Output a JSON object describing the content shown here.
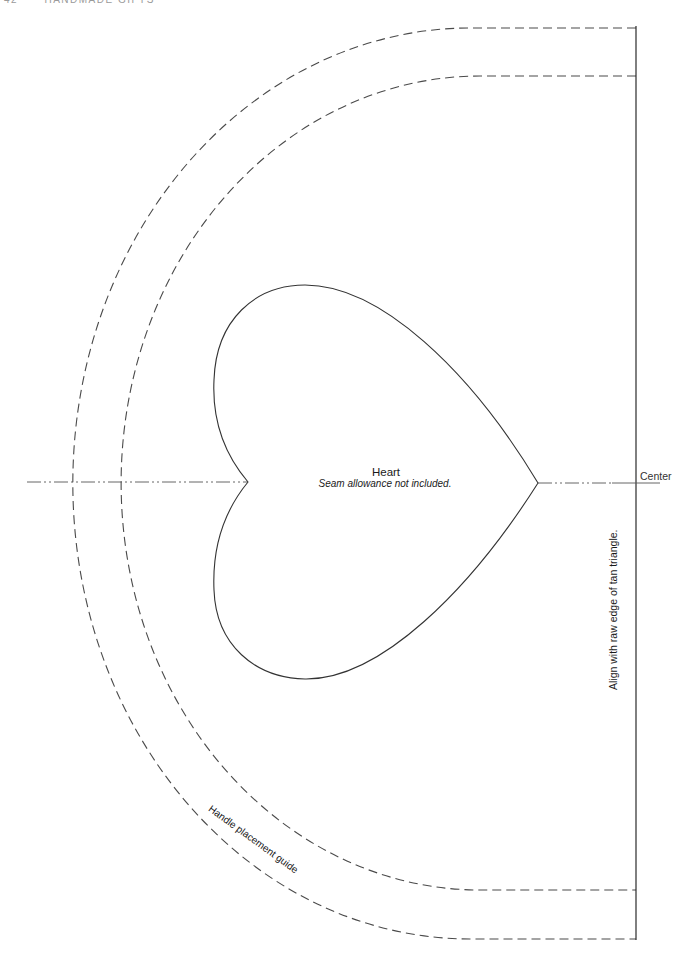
{
  "running_head": {
    "page_number": "42",
    "title": "Handmade Gifts"
  },
  "pattern": {
    "piece_name": "Heart",
    "piece_note": "Seam allowance not included.",
    "center_label": "Center",
    "fold_edge_label": "Align with raw edge of tan triangle.",
    "guide_label": "Handle placement guide",
    "line_color": "#3a3a3a",
    "dash_color": "#4a4a4a"
  }
}
